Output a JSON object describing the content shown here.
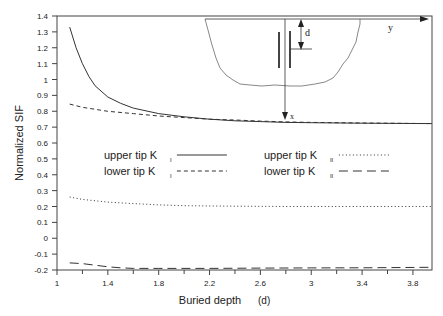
{
  "chart_data": {
    "type": "line",
    "title": "",
    "xlabel": "Buried depth",
    "xlabel_symbol": "(d)",
    "ylabel": "Normalized SIF",
    "xlim": [
      1,
      3.95
    ],
    "ylim": [
      -0.2,
      1.4
    ],
    "xticks": [
      1,
      1.4,
      1.8,
      2.2,
      2.6,
      3,
      3.4,
      3.8
    ],
    "xtick_labels": [
      "1",
      "1.4",
      "1.8",
      "2.2",
      "2.6",
      "3",
      "3.4",
      "3.8"
    ],
    "xminor": [
      1.2,
      1.6,
      2.0,
      2.4,
      2.8,
      3.2,
      3.6
    ],
    "yticks": [
      -0.2,
      -0.1,
      0,
      0.1,
      0.2,
      0.3,
      0.4,
      0.5,
      0.6,
      0.7,
      0.8,
      0.9,
      1,
      1.1,
      1.2,
      1.3,
      1.4
    ],
    "ytick_labels": [
      "-0.2",
      "-0.1",
      "0",
      "0.1",
      "0.2",
      "0.3",
      "0.4",
      "0.5",
      "0.6",
      "0.7",
      "0.8",
      "0.9",
      "1",
      "1.1",
      "1.2",
      "1.3",
      "1.4"
    ],
    "grid": false,
    "legend_position": "center",
    "series": [
      {
        "name": "upper tip K_I",
        "style": "solid",
        "x": [
          1.1,
          1.15,
          1.2,
          1.25,
          1.3,
          1.4,
          1.5,
          1.6,
          1.8,
          2.0,
          2.2,
          2.4,
          2.6,
          2.8,
          3.0,
          3.4,
          3.95
        ],
        "y": [
          1.33,
          1.2,
          1.1,
          1.02,
          0.96,
          0.89,
          0.85,
          0.82,
          0.785,
          0.765,
          0.75,
          0.74,
          0.735,
          0.73,
          0.728,
          0.725,
          0.722
        ]
      },
      {
        "name": "lower tip K_I",
        "style": "dashed",
        "x": [
          1.1,
          1.2,
          1.4,
          1.6,
          1.8,
          2.0,
          2.2,
          2.4,
          2.6,
          2.8,
          3.0,
          3.4,
          3.95
        ],
        "y": [
          0.845,
          0.825,
          0.8,
          0.785,
          0.77,
          0.76,
          0.75,
          0.745,
          0.738,
          0.733,
          0.73,
          0.726,
          0.722
        ]
      },
      {
        "name": "upper tip K_II",
        "style": "dotted",
        "x": [
          1.1,
          1.2,
          1.4,
          1.6,
          1.8,
          2.0,
          2.4,
          2.8,
          3.2,
          3.6,
          3.95
        ],
        "y": [
          0.26,
          0.245,
          0.228,
          0.218,
          0.21,
          0.205,
          0.202,
          0.2,
          0.2,
          0.2,
          0.2
        ]
      },
      {
        "name": "lower tip K_II",
        "style": "longdash",
        "x": [
          1.1,
          1.2,
          1.3,
          1.4,
          1.5,
          1.6,
          1.8,
          2.2,
          2.6,
          3.0,
          3.4,
          3.95
        ],
        "y": [
          -0.155,
          -0.16,
          -0.17,
          -0.18,
          -0.186,
          -0.19,
          -0.19,
          -0.19,
          -0.188,
          -0.187,
          -0.186,
          -0.183
        ]
      }
    ]
  },
  "legend": {
    "items": [
      {
        "prefix": "upper tip K",
        "sub": "I",
        "style": "solid"
      },
      {
        "prefix": "lower tip K",
        "sub": "I",
        "style": "dashed"
      },
      {
        "prefix": "upper tip K",
        "sub": "II",
        "style": "dotted"
      },
      {
        "prefix": "lower tip K",
        "sub": "II",
        "style": "longdash"
      }
    ]
  },
  "inset": {
    "label_d": "d",
    "label_y": "y",
    "label_x": "x"
  },
  "colors": {
    "line": "#333333",
    "axis": "#444444",
    "background": "#ffffff"
  }
}
